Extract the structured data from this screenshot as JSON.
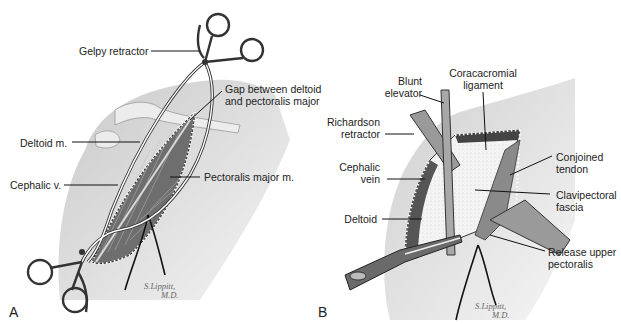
{
  "figure": {
    "panels": [
      {
        "id": "A",
        "letter": "A",
        "signature": {
          "line1": "S.Lippitt,",
          "line2": "M.D."
        },
        "labels": {
          "gelpy_retractor": "Gelpy retractor",
          "gap_line1": "Gap between deltoid",
          "gap_line2": "and pectoralis major",
          "deltoid": "Deltoid m.",
          "cephalic": "Cephalic v.",
          "pectoralis": "Pectoralis major m."
        }
      },
      {
        "id": "B",
        "letter": "B",
        "signature": {
          "line1": "S.Lippitt,",
          "line2": "M.D."
        },
        "labels": {
          "blunt_line1": "Blunt",
          "blunt_line2": "elevator",
          "coraco_line1": "Coracacromial",
          "coraco_line2": "ligament",
          "richardson_line1": "Richardson",
          "richardson_line2": "retractor",
          "cephalic_line1": "Cephalic",
          "cephalic_line2": "vein",
          "conjoined_line1": "Conjoined",
          "conjoined_line2": "tendon",
          "clavi_line1": "Clavipectoral",
          "clavi_line2": "fascia",
          "deltoid": "Deltoid",
          "release_line1": "Release upper",
          "release_line2": "pectoralis"
        }
      }
    ],
    "colors": {
      "skin": "#d6d6d6",
      "muscle": "#7a7a7a",
      "fascia": "#f2f2f2",
      "ink": "#222222"
    }
  }
}
